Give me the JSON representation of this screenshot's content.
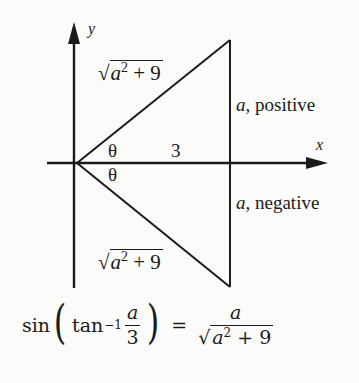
{
  "diagram": {
    "type": "right-triangle-trig",
    "axes": {
      "x_label": "x",
      "y_label": "y"
    },
    "labels": {
      "hypotenuse_top": {
        "radical": "√",
        "base": "a",
        "exponent": "2",
        "rest": " + 9"
      },
      "hypotenuse_bottom": {
        "radical": "√",
        "base": "a",
        "exponent": "2",
        "rest": " + 9"
      },
      "adjacent": "3",
      "angle_top": "θ",
      "angle_bottom": "θ",
      "opposite_top": {
        "var": "a",
        "text": ", positive"
      },
      "opposite_bottom": {
        "var": "a",
        "text": ", negative"
      }
    },
    "geometry": {
      "origin": [
        77,
        163
      ],
      "top_vertex": [
        230,
        40
      ],
      "bottom_vertex": [
        230,
        287
      ],
      "adjacent_end": [
        230,
        163
      ]
    },
    "stroke_color": "#1a1a1a",
    "background": "#fbfbfa"
  },
  "formula": {
    "func": "sin",
    "inner_func": "tan",
    "inner_exp": "−1",
    "frac_num": "a",
    "frac_den": "3",
    "equals": "=",
    "rhs_num": "a",
    "rhs_den": {
      "radical": "√",
      "base": "a",
      "exponent": "2",
      "rest": " + 9"
    }
  }
}
